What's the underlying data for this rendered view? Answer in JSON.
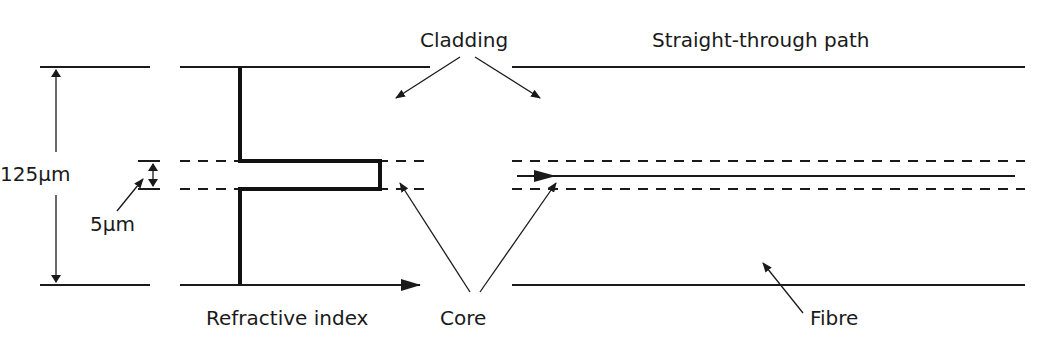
{
  "diagram": {
    "labels": {
      "cladding": "Cladding",
      "straight_through_path": "Straight-through path",
      "outer_diameter": "125μm",
      "core_diameter": "5μm",
      "refractive_index": "Refractive index",
      "core": "Core",
      "fibre": "Fibre"
    },
    "dimensions": {
      "cladding_diameter_um": 125,
      "core_diameter_um": 5
    },
    "colors": {
      "line": "#1a1a1a",
      "background": "#ffffff"
    }
  }
}
